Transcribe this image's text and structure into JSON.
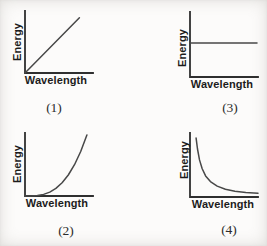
{
  "page": {
    "background": "#fcfbfa"
  },
  "colors": {
    "axis": "#2f2f2f",
    "curve": "#484848",
    "label_text": "#1c1c1c",
    "caption_text": "#2b2b2b"
  },
  "chart_data": [
    {
      "type": "line",
      "caption": "(1)",
      "xlabel": "Wavelength",
      "ylabel": "Energy",
      "relationship": "linear increase",
      "axes": "unlabeled qualitative axes, no ticks, grid off",
      "series": [
        {
          "name": "energy-vs-wavelength",
          "points": [
            [
              0,
              0
            ],
            [
              0.8,
              0.89
            ]
          ]
        }
      ]
    },
    {
      "type": "line",
      "caption": "(3)",
      "xlabel": "Wavelength",
      "ylabel": "Energy",
      "relationship": "constant (energy independent of wavelength)",
      "axes": "unlabeled qualitative axes, no ticks, grid off",
      "series": [
        {
          "name": "energy-vs-wavelength",
          "points": [
            [
              0,
              0.523
            ],
            [
              0.985,
              0.523
            ]
          ]
        }
      ]
    },
    {
      "type": "line",
      "caption": "(2)",
      "xlabel": "Wavelength",
      "ylabel": "Energy",
      "relationship": "accelerating (concave-up) increase",
      "axes": "unlabeled qualitative axes, no ticks, grid off",
      "series": [
        {
          "name": "energy-vs-wavelength",
          "points": [
            [
              0,
              0
            ],
            [
              0.091,
              0.001
            ],
            [
              0.182,
              0.008
            ],
            [
              0.273,
              0.026
            ],
            [
              0.364,
              0.062
            ],
            [
              0.455,
              0.121
            ],
            [
              0.546,
              0.21
            ],
            [
              0.637,
              0.333
            ],
            [
              0.728,
              0.497
            ],
            [
              0.819,
              0.707
            ],
            [
              0.91,
              0.97
            ]
          ]
        }
      ]
    },
    {
      "type": "line",
      "caption": "(4)",
      "xlabel": "Wavelength",
      "ylabel": "Energy",
      "relationship": "inverse (hyperbolic) decrease",
      "axes": "unlabeled qualitative axes, no ticks, grid off",
      "series": [
        {
          "name": "energy-vs-wavelength",
          "points": [
            [
              0.09,
              0.92
            ],
            [
              0.11,
              0.75
            ],
            [
              0.14,
              0.58
            ],
            [
              0.18,
              0.44
            ],
            [
              0.23,
              0.33
            ],
            [
              0.3,
              0.24
            ],
            [
              0.4,
              0.17
            ],
            [
              0.52,
              0.12
            ],
            [
              0.66,
              0.09
            ],
            [
              0.82,
              0.07
            ],
            [
              1.0,
              0.06
            ]
          ]
        }
      ]
    }
  ]
}
